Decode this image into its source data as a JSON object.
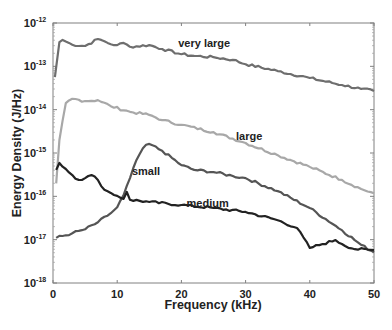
{
  "chart_data": {
    "type": "line",
    "title": "",
    "xlabel": "Frequency (kHz)",
    "ylabel": "Energy Density (J/Hz)",
    "xlim": [
      0,
      50
    ],
    "ylim": [
      1e-18,
      1e-12
    ],
    "yscale": "log",
    "grid": false,
    "legend": "inline labels",
    "x_ticks": [
      0,
      10,
      20,
      30,
      40,
      50
    ],
    "y_ticks": [
      {
        "base": "10",
        "exp": "-12"
      },
      {
        "base": "10",
        "exp": "-13"
      },
      {
        "base": "10",
        "exp": "-14"
      },
      {
        "base": "10",
        "exp": "-15"
      },
      {
        "base": "10",
        "exp": "-16"
      },
      {
        "base": "10",
        "exp": "-17"
      },
      {
        "base": "10",
        "exp": "-18"
      }
    ],
    "series": [
      {
        "name": "very large",
        "color": "#6e6e6e",
        "label_pos": {
          "x": 19.5,
          "log_y": -12.55
        },
        "x": [
          0.3,
          1,
          1.5,
          3,
          5,
          7,
          8,
          9,
          10,
          11,
          12,
          15,
          17,
          20,
          22,
          25,
          28,
          30,
          35,
          40,
          45,
          48,
          50
        ],
        "log_y": [
          -13.25,
          -12.44,
          -12.39,
          -12.5,
          -12.53,
          -12.37,
          -12.42,
          -12.49,
          -12.51,
          -12.46,
          -12.55,
          -12.51,
          -12.6,
          -12.72,
          -12.76,
          -12.79,
          -12.85,
          -12.95,
          -13.11,
          -13.27,
          -13.43,
          -13.52,
          -13.57
        ]
      },
      {
        "name": "large",
        "color": "#a8a8a8",
        "label_pos": {
          "x": 28.5,
          "log_y": -14.7
        },
        "x": [
          0.5,
          1,
          2,
          3,
          5,
          7,
          9,
          12,
          15,
          17,
          20,
          25,
          30,
          35,
          40,
          45,
          48,
          50
        ],
        "log_y": [
          -15.7,
          -14.7,
          -13.85,
          -13.75,
          -13.8,
          -13.78,
          -13.92,
          -14.05,
          -14.12,
          -14.24,
          -14.35,
          -14.52,
          -14.77,
          -15.05,
          -15.32,
          -15.62,
          -15.83,
          -15.93
        ]
      },
      {
        "name": "small",
        "color": "#555555",
        "label_pos": {
          "x": 12.3,
          "log_y": -15.5
        },
        "x": [
          0.5,
          3,
          5,
          7,
          9,
          10,
          11,
          12,
          13,
          14,
          15,
          17,
          20,
          22,
          25,
          28,
          30,
          35,
          40,
          45,
          48,
          50
        ],
        "log_y": [
          -16.96,
          -16.85,
          -16.76,
          -16.6,
          -16.39,
          -16.25,
          -15.97,
          -15.58,
          -15.16,
          -14.89,
          -14.79,
          -14.95,
          -15.28,
          -15.39,
          -15.44,
          -15.53,
          -15.58,
          -15.88,
          -16.27,
          -16.78,
          -17.12,
          -17.29
        ]
      },
      {
        "name": "medium",
        "color": "#222222",
        "label_pos": {
          "x": 20.8,
          "log_y": -16.25
        },
        "x": [
          0.5,
          1,
          2,
          3,
          4,
          5,
          6,
          7,
          8,
          9,
          10,
          11,
          11.5,
          12,
          15,
          20,
          25,
          30,
          35,
          38,
          40,
          42,
          44,
          45,
          47,
          50
        ],
        "log_y": [
          -15.39,
          -15.23,
          -15.37,
          -15.51,
          -15.62,
          -15.58,
          -15.51,
          -15.62,
          -15.85,
          -15.92,
          -15.99,
          -16.06,
          -15.9,
          -16.08,
          -16.13,
          -16.2,
          -16.27,
          -16.36,
          -16.55,
          -16.73,
          -17.19,
          -17.1,
          -17.01,
          -17.1,
          -17.22,
          -17.24
        ]
      }
    ]
  }
}
